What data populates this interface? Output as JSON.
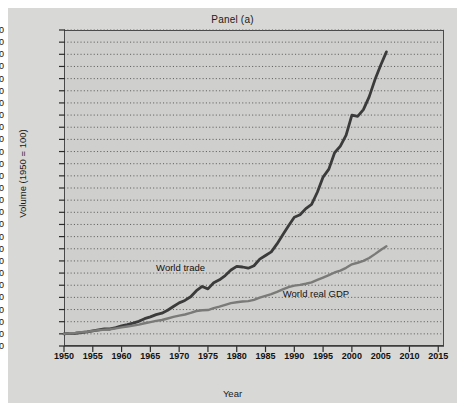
{
  "chart_data": {
    "type": "line",
    "title": "Panel (a)",
    "xlabel": "Year",
    "ylabel": "Volume (1950 = 100)",
    "xlim": [
      1950,
      2016
    ],
    "ylim": [
      0,
      2600
    ],
    "grid": true,
    "legend_position": "inline-annotation",
    "y_ticks": [
      0,
      100,
      200,
      300,
      400,
      500,
      600,
      700,
      800,
      900,
      1000,
      1100,
      1200,
      1300,
      1400,
      1500,
      1600,
      1700,
      1800,
      1900,
      2000,
      2100,
      2200,
      2300,
      2400,
      2500,
      2600
    ],
    "y_tick_labels": [
      "0",
      "100",
      "200",
      "300",
      "400",
      "500",
      "600",
      "700",
      "800",
      "900",
      "1,000",
      "1,100",
      "1,200",
      "1,300",
      "1,400",
      "1,500",
      "1,600",
      "1,700",
      "1,800",
      "1,900",
      "2,000",
      "2,100",
      "2,200",
      "2,300",
      "2,400",
      "2,500",
      "2,600"
    ],
    "x_ticks": [
      1950,
      1955,
      1960,
      1965,
      1970,
      1975,
      1980,
      1985,
      1990,
      1995,
      2000,
      2005,
      2010,
      2015
    ],
    "x_tick_labels": [
      "1950",
      "1955",
      "1960",
      "1965",
      "1970",
      "1975",
      "1980",
      "1985",
      "1990",
      "1995",
      "2000",
      "2005",
      "2010",
      "2015"
    ],
    "series": [
      {
        "name": "World trade",
        "color": "#3b3b3b",
        "label_x": 1966,
        "label_y": 640,
        "x": [
          1950,
          1951,
          1952,
          1953,
          1954,
          1955,
          1956,
          1957,
          1958,
          1959,
          1960,
          1961,
          1962,
          1963,
          1964,
          1965,
          1966,
          1967,
          1968,
          1969,
          1970,
          1971,
          1972,
          1973,
          1974,
          1975,
          1976,
          1977,
          1978,
          1979,
          1980,
          1981,
          1982,
          1983,
          1984,
          1985,
          1986,
          1987,
          1988,
          1989,
          1990,
          1991,
          1992,
          1993,
          1994,
          1995,
          1996,
          1997,
          1998,
          1999,
          2000,
          2001,
          2002,
          2003,
          2004,
          2005,
          2006
        ],
        "values": [
          100,
          104,
          105,
          110,
          116,
          124,
          133,
          140,
          140,
          151,
          166,
          176,
          188,
          203,
          225,
          240,
          258,
          270,
          294,
          325,
          355,
          375,
          405,
          455,
          490,
          470,
          520,
          545,
          580,
          625,
          655,
          650,
          640,
          660,
          715,
          745,
          775,
          840,
          915,
          990,
          1060,
          1080,
          1130,
          1165,
          1265,
          1390,
          1455,
          1590,
          1645,
          1735,
          1900,
          1890,
          1945,
          2050,
          2190,
          2310,
          2420
        ]
      },
      {
        "name": "World real GDP",
        "color": "#7a7a78",
        "label_x": 1988,
        "label_y": 430,
        "x": [
          1950,
          1951,
          1952,
          1953,
          1954,
          1955,
          1956,
          1957,
          1958,
          1959,
          1960,
          1961,
          1962,
          1963,
          1964,
          1965,
          1966,
          1967,
          1968,
          1969,
          1970,
          1971,
          1972,
          1973,
          1974,
          1975,
          1976,
          1977,
          1978,
          1979,
          1980,
          1981,
          1982,
          1983,
          1984,
          1985,
          1986,
          1987,
          1988,
          1989,
          1990,
          1991,
          1992,
          1993,
          1994,
          1995,
          1996,
          1997,
          1998,
          1999,
          2000,
          2001,
          2002,
          2003,
          2004,
          2005,
          2006
        ],
        "values": [
          100,
          105,
          108,
          113,
          117,
          124,
          130,
          135,
          138,
          145,
          153,
          160,
          168,
          176,
          187,
          197,
          207,
          214,
          226,
          239,
          250,
          259,
          272,
          288,
          294,
          296,
          311,
          324,
          339,
          353,
          360,
          366,
          369,
          380,
          398,
          413,
          427,
          445,
          466,
          484,
          497,
          503,
          512,
          524,
          544,
          563,
          583,
          605,
          620,
          643,
          672,
          685,
          700,
          724,
          756,
          790,
          820
        ]
      }
    ]
  }
}
